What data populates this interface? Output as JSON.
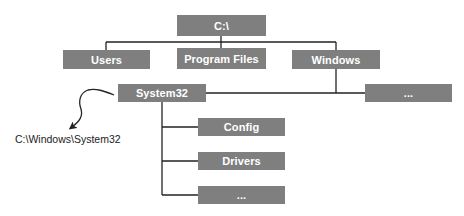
{
  "diagram": {
    "type": "directory-tree",
    "colors": {
      "node_fill": "#7f7f7f",
      "node_text": "#ffffff",
      "connector": "#222222",
      "label_text": "#222222"
    },
    "nodes": {
      "root": {
        "label": "C:\\"
      },
      "users": {
        "label": "Users"
      },
      "program_files": {
        "label": "Program Files"
      },
      "windows": {
        "label": "Windows"
      },
      "system32": {
        "label": "System32"
      },
      "windows_more": {
        "label": "..."
      },
      "config": {
        "label": "Config"
      },
      "drivers": {
        "label": "Drivers"
      },
      "system32_more": {
        "label": "..."
      }
    },
    "edges": [
      {
        "from": "root",
        "to": "users"
      },
      {
        "from": "root",
        "to": "program_files"
      },
      {
        "from": "root",
        "to": "windows"
      },
      {
        "from": "windows",
        "to": "system32"
      },
      {
        "from": "windows",
        "to": "windows_more"
      },
      {
        "from": "system32",
        "to": "config"
      },
      {
        "from": "system32",
        "to": "drivers"
      },
      {
        "from": "system32",
        "to": "system32_more"
      }
    ],
    "annotation": {
      "label": "C:\\Windows\\System32",
      "points_from": "system32"
    }
  }
}
